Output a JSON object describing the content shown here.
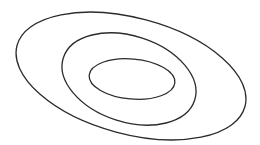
{
  "diagram": {
    "type": "nested-ellipses",
    "background": "#ffffff",
    "stroke_color": "#2b2b2b",
    "stroke_width": 1.3,
    "ellipses": [
      {
        "name": "outer",
        "cx": 131,
        "cy": 76,
        "rx": 118,
        "ry": 58,
        "rotate": 15
      },
      {
        "name": "middle",
        "cx": 129,
        "cy": 79,
        "rx": 69,
        "ry": 43,
        "rotate": 18
      },
      {
        "name": "inner",
        "cx": 132,
        "cy": 79,
        "rx": 43,
        "ry": 20,
        "rotate": 5
      }
    ]
  }
}
